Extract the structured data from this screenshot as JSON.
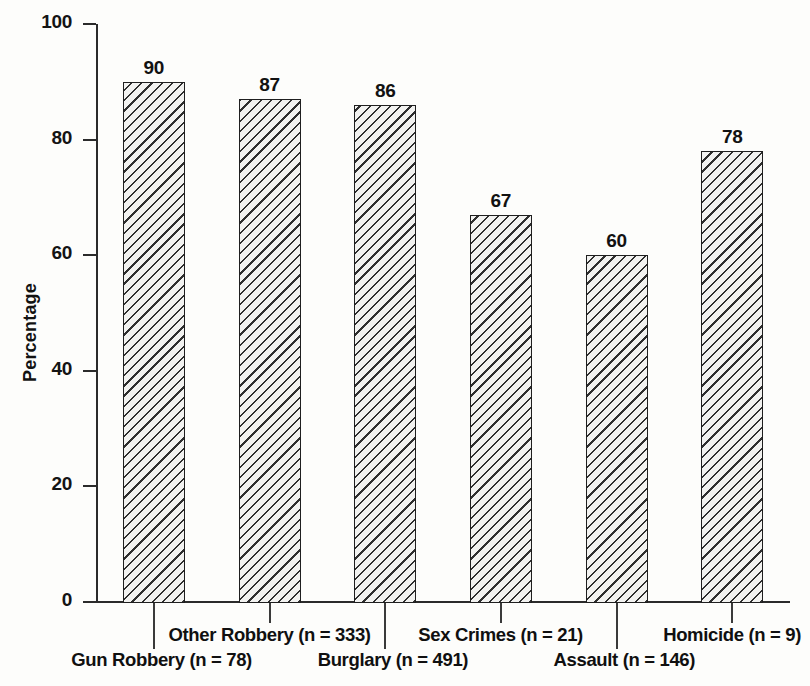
{
  "chart_data": {
    "type": "bar",
    "title": "",
    "xlabel": "",
    "ylabel": "Percentage",
    "ylim": [
      0,
      100
    ],
    "yticks": [
      0,
      20,
      40,
      60,
      80,
      100
    ],
    "grid": false,
    "legend": "none",
    "categories": [
      "Gun Robbery (n = 78)",
      "Other Robbery (n = 333)",
      "Burglary (n = 491)",
      "Sex Crimes (n = 21)",
      "Assault (n = 146)",
      "Homicide (n = 9)"
    ],
    "values": [
      90,
      87,
      86,
      67,
      60,
      78
    ],
    "value_labels": [
      "90",
      "87",
      "86",
      "67",
      "60",
      "78"
    ],
    "bar_style": {
      "fill": "diagonal-hatch",
      "hatch_color": "#2e2e2e",
      "background": "#f2f2f0",
      "outline": "#1f1f1f"
    },
    "label_rows": [
      2,
      1,
      2,
      1,
      2,
      1
    ]
  },
  "axis": {
    "y_title": "Percentage",
    "y_tick_labels": [
      "100",
      "80",
      "60",
      "40",
      "20",
      "0"
    ]
  },
  "colors": {
    "ink": "#141414",
    "page": "#fdfdfb",
    "hatch": "#2e2e2e"
  }
}
